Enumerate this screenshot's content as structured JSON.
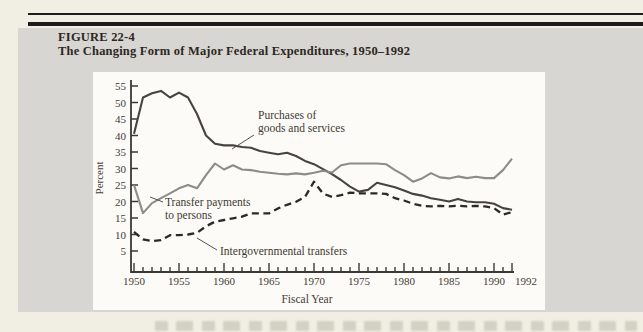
{
  "figure": {
    "label": "FIGURE 22-4",
    "title": "The Changing Form of Major Federal Expenditures, 1950–1992"
  },
  "colors": {
    "page_background": "#f1eee3",
    "panel_gray": "#d7d6d2",
    "chart_background": "#fcfbf7",
    "rule_black": "#1d1c1a",
    "axis": "#3b3935",
    "purchases_line": "#474440",
    "transfers_line": "#8c8c88",
    "intergov_line": "#2b2a27",
    "label_text": "#433d35"
  },
  "chart_data": {
    "type": "line",
    "title": "",
    "xlabel": "Fiscal Year",
    "ylabel": "Percent",
    "grid": false,
    "legend_position": "none",
    "x_range": [
      1950,
      1992
    ],
    "ylim": [
      5,
      55
    ],
    "y_ticks": [
      5,
      10,
      15,
      20,
      25,
      30,
      35,
      40,
      45,
      50,
      55
    ],
    "x_tick_labels": [
      "1950",
      "1955",
      "1960",
      "1965",
      "1970",
      "1975",
      "1980",
      "1985",
      "1990",
      "1992"
    ],
    "years": [
      1950,
      1951,
      1952,
      1953,
      1954,
      1955,
      1956,
      1957,
      1958,
      1959,
      1960,
      1961,
      1962,
      1963,
      1964,
      1965,
      1966,
      1967,
      1968,
      1969,
      1970,
      1971,
      1972,
      1973,
      1974,
      1975,
      1976,
      1977,
      1978,
      1979,
      1980,
      1981,
      1982,
      1983,
      1984,
      1985,
      1986,
      1987,
      1988,
      1989,
      1990,
      1991,
      1992
    ],
    "series": [
      {
        "name": "Purchases of goods and services",
        "style": "solid",
        "color": "#474440",
        "values": [
          40.5,
          51.5,
          52.8,
          53.5,
          51.5,
          53.0,
          51.5,
          46.5,
          40.0,
          37.5,
          37.0,
          37.0,
          36.5,
          36.3,
          35.3,
          34.8,
          34.3,
          34.8,
          33.8,
          32.3,
          31.3,
          29.8,
          28.3,
          26.5,
          24.5,
          23.0,
          23.5,
          25.7,
          25.0,
          24.3,
          23.3,
          22.3,
          21.8,
          21.0,
          20.5,
          20.0,
          20.8,
          20.0,
          19.8,
          19.8,
          19.3,
          18.0,
          17.5
        ]
      },
      {
        "name": "Transfer payments to persons",
        "style": "solid",
        "color": "#8c8c88",
        "values": [
          25.0,
          16.5,
          19.5,
          21.0,
          22.5,
          24.0,
          25.0,
          24.0,
          28.0,
          31.5,
          29.7,
          31.0,
          29.7,
          29.5,
          29.0,
          28.7,
          28.4,
          28.2,
          28.5,
          28.2,
          28.7,
          29.3,
          28.8,
          31.0,
          31.5,
          31.5,
          31.5,
          31.5,
          31.3,
          29.5,
          28.0,
          26.0,
          27.0,
          28.6,
          27.3,
          27.0,
          27.6,
          27.1,
          27.5,
          27.1,
          27.1,
          29.5,
          33.0
        ]
      },
      {
        "name": "Intergovernmental transfers",
        "style": "dashed",
        "color": "#2b2a27",
        "values": [
          10.8,
          8.5,
          8.0,
          8.3,
          9.8,
          9.8,
          10.0,
          10.5,
          12.5,
          13.9,
          14.4,
          14.9,
          15.4,
          16.4,
          16.4,
          16.4,
          17.9,
          19.0,
          19.9,
          21.4,
          26.0,
          22.4,
          21.4,
          21.9,
          22.7,
          22.5,
          22.5,
          22.5,
          22.3,
          21.0,
          20.3,
          19.3,
          18.7,
          18.5,
          18.7,
          18.5,
          18.7,
          18.5,
          18.7,
          18.5,
          18.0,
          16.0,
          16.8
        ]
      }
    ],
    "annotations": [
      {
        "lines": [
          "Purchases of",
          "goods and services"
        ]
      },
      {
        "lines": [
          "Transfer payments",
          "to persons"
        ]
      },
      {
        "lines": [
          "Intergovernmental transfers"
        ]
      }
    ]
  }
}
